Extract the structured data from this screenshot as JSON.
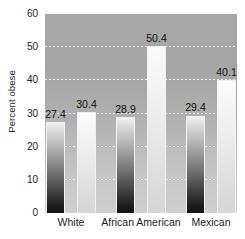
{
  "chart_data": {
    "type": "bar",
    "title": "",
    "xlabel": "",
    "ylabel": "Percent obese",
    "ylim": [
      0,
      60
    ],
    "yticks": [
      60,
      50,
      40,
      30,
      20,
      10,
      0
    ],
    "grid": true,
    "legend": "none",
    "categories": [
      "White",
      "African American",
      "Mexican"
    ],
    "series": [
      {
        "name": "series-1",
        "style": "dark-gradient",
        "values": [
          27.4,
          28.9,
          29.4
        ]
      },
      {
        "name": "series-2",
        "style": "light-gradient",
        "values": [
          30.4,
          50.4,
          40.1
        ]
      }
    ],
    "bars": [
      {
        "label": "27.4",
        "value": 27.4,
        "group": "White",
        "series": "series-1",
        "style": "dark"
      },
      {
        "label": "30.4",
        "value": 30.4,
        "group": "White",
        "series": "series-2",
        "style": "light"
      },
      {
        "label": "28.9",
        "value": 28.9,
        "group": "African American",
        "series": "series-1",
        "style": "dark"
      },
      {
        "label": "50.4",
        "value": 50.4,
        "group": "African American",
        "series": "series-2",
        "style": "light"
      },
      {
        "label": "29.4",
        "value": 29.4,
        "group": "Mexican",
        "series": "series-1",
        "style": "dark"
      },
      {
        "label": "40.1",
        "value": 40.1,
        "group": "Mexican",
        "series": "series-2",
        "style": "light"
      }
    ],
    "colors": {
      "plot_background_top": "#a8a8a8",
      "plot_background_bottom": "#cfcfcf",
      "gridline": "#ffffff",
      "bar_dark_top": "#f0f0f0",
      "bar_dark_bottom": "#141414",
      "bar_light_top": "#fbfbfb",
      "bar_light_bottom": "#d6d6d6",
      "text": "#1c1c1c",
      "page_background": "#ffffff"
    }
  }
}
